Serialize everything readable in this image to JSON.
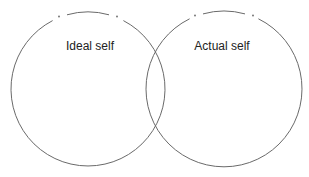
{
  "diagram": {
    "type": "venn",
    "stroke_color": "#6a6a6a",
    "background": "#ffffff",
    "circles": [
      {
        "label": "Ideal self",
        "cx": 88,
        "cy": 89,
        "r": 77
      },
      {
        "label": "Actual self",
        "cx": 224,
        "cy": 89,
        "r": 78
      }
    ]
  }
}
